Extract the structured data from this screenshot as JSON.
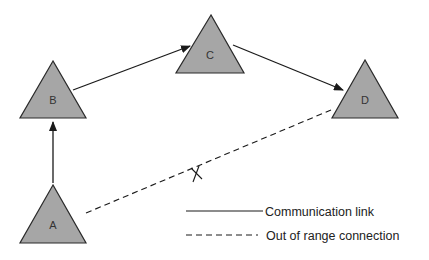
{
  "diagram": {
    "title": "",
    "colors": {
      "node_fill": "#a6a6a6",
      "node_stroke": "#2a2a2a",
      "edge": "#1a1a1a",
      "background": "#ffffff"
    },
    "nodes": [
      {
        "id": "A",
        "label": "A",
        "apex": [
          53,
          185
        ],
        "base_left": [
          20,
          243
        ],
        "base_right": [
          86,
          243
        ],
        "label_pos": [
          53,
          229
        ]
      },
      {
        "id": "B",
        "label": "B",
        "apex": [
          53,
          61
        ],
        "base_left": [
          20,
          118
        ],
        "base_right": [
          86,
          118
        ],
        "label_pos": [
          53,
          104
        ]
      },
      {
        "id": "C",
        "label": "C",
        "apex": [
          211,
          15
        ],
        "base_left": [
          176,
          73
        ],
        "base_right": [
          244,
          73
        ],
        "label_pos": [
          210,
          59
        ]
      },
      {
        "id": "D",
        "label": "D",
        "apex": [
          365,
          60
        ],
        "base_left": [
          332,
          118
        ],
        "base_right": [
          398,
          118
        ],
        "label_pos": [
          365,
          104
        ]
      }
    ],
    "edges": [
      {
        "from": "A",
        "to": "B",
        "type": "communication-link",
        "style": "solid",
        "arrow": true,
        "x1": 53,
        "y1": 183,
        "x2": 53,
        "y2": 122
      },
      {
        "from": "B",
        "to": "C",
        "type": "communication-link",
        "style": "solid",
        "arrow": true,
        "x1": 73,
        "y1": 90,
        "x2": 190,
        "y2": 46
      },
      {
        "from": "C",
        "to": "D",
        "type": "communication-link",
        "style": "solid",
        "arrow": true,
        "x1": 233,
        "y1": 45,
        "x2": 343,
        "y2": 90
      },
      {
        "from": "A",
        "to": "D",
        "type": "out-of-range-connection",
        "style": "dashed",
        "arrow": false,
        "x1": 86,
        "y1": 213,
        "x2": 331,
        "y2": 110,
        "broken_marker": [
          196,
          174
        ]
      }
    ],
    "legend": {
      "items": [
        {
          "style": "solid",
          "label": "Communication link"
        },
        {
          "style": "dashed",
          "label": "Out of range connection"
        }
      ]
    }
  }
}
